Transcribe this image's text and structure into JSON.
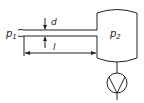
{
  "diagram": {
    "type": "vacuum-system-schematic",
    "labels": {
      "inlet_pressure": "p",
      "inlet_pressure_sub": "1",
      "tank_pressure": "p",
      "tank_pressure_sub": "2",
      "diameter": "d",
      "length": "l"
    },
    "components": [
      "tube",
      "vessel",
      "pump"
    ],
    "colors": {
      "stroke": "#222222",
      "background": "#ffffff"
    }
  }
}
